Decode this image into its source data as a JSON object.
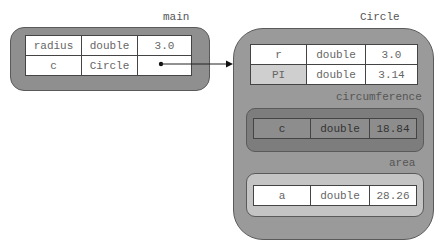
{
  "frames": {
    "main": {
      "label": "main",
      "rows": [
        {
          "name": "radius",
          "type": "double",
          "value": "3.0"
        },
        {
          "name": "c",
          "type": "Circle",
          "value": ""
        }
      ]
    },
    "circle": {
      "label": "Circle",
      "rows": [
        {
          "name": "r",
          "type": "double",
          "value": "3.0"
        },
        {
          "name": "PI",
          "type": "double",
          "value": "3.14"
        }
      ],
      "methods": {
        "circumference": {
          "label": "circumference",
          "rows": [
            {
              "name": "c",
              "type": "double",
              "value": "18.84"
            }
          ]
        },
        "area": {
          "label": "area",
          "rows": [
            {
              "name": "a",
              "type": "double",
              "value": "28.26"
            }
          ]
        }
      }
    }
  },
  "colors": {
    "main_frame_fill": "#8f8f8f",
    "circle_frame_fill": "#9a9a9a",
    "circumference_frame_fill": "#7d7d7d",
    "area_frame_fill": "#c4c4c4",
    "pi_cell_fill": "#cfcfcf",
    "circumference_cell_fill": "#8d8d8d"
  }
}
